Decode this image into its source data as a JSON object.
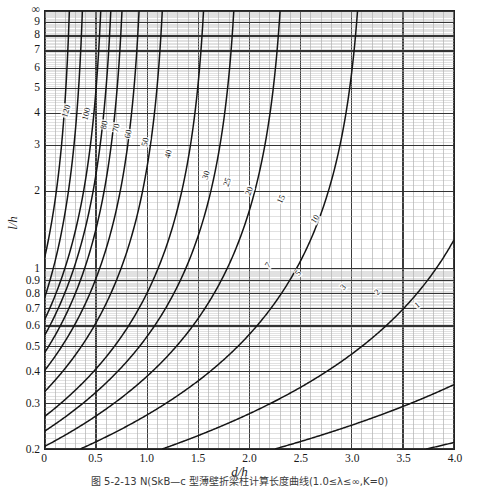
{
  "figure": {
    "caption": "图 5-2-13  N(SkB—c 型薄壁折梁柱计算长度曲线(1.0≤λ≤∞,K=0)",
    "x_axis_title": "d/h",
    "y_axis_title": "l/h"
  },
  "chart_data": {
    "type": "line",
    "title": "",
    "xlabel": "d/h",
    "ylabel": "l/h",
    "xlim": [
      0,
      4.0
    ],
    "ylim": [
      0.2,
      10
    ],
    "xscale": "linear",
    "yscale": "log",
    "grid": true,
    "legend": "inline-curve-labels",
    "ytick_labels": [
      "0.2",
      "0.3",
      "0.4",
      "0.5",
      "0.6",
      "0.7",
      "0.8",
      "0.9",
      "1",
      "2",
      "3",
      "4",
      "5",
      "6",
      "7",
      "8",
      "9",
      "∞"
    ],
    "ytick_values": [
      0.2,
      0.3,
      0.4,
      0.5,
      0.6,
      0.7,
      0.8,
      0.9,
      1,
      2,
      3,
      4,
      5,
      6,
      7,
      8,
      9,
      10
    ],
    "xtick_labels": [
      "0",
      "0.5",
      "1.0",
      "1.5",
      "2.0",
      "2.5",
      "3.0",
      "3.5",
      "4.0"
    ],
    "xtick_values": [
      0,
      0.5,
      1.0,
      1.5,
      2.0,
      2.5,
      3.0,
      3.5,
      4.0
    ],
    "minor_grid_x_step": 0.1,
    "series": [
      {
        "name": "120",
        "asymptote_x": 0.28,
        "y_at_x0": 1.12,
        "label_x": 0.2,
        "label_y": 4.1,
        "label_angle": -72
      },
      {
        "name": "100",
        "asymptote_x": 0.41,
        "y_at_x0": 0.78,
        "label_x": 0.395,
        "label_y": 4.0,
        "label_angle": -76
      },
      {
        "name": "80",
        "asymptote_x": 0.6,
        "y_at_x0": 0.64,
        "label_x": 0.575,
        "label_y": 3.62,
        "label_angle": -78
      },
      {
        "name": "70",
        "asymptote_x": 0.7,
        "y_at_x0": 0.555,
        "label_x": 0.695,
        "label_y": 3.52,
        "label_angle": -78
      },
      {
        "name": "60",
        "asymptote_x": 0.81,
        "y_at_x0": 0.475,
        "label_x": 0.805,
        "label_y": 3.35,
        "label_angle": -78
      },
      {
        "name": "50",
        "asymptote_x": 0.98,
        "y_at_x0": 0.405,
        "label_x": 0.975,
        "label_y": 3.12,
        "label_angle": -78
      },
      {
        "name": "40",
        "asymptote_x": 1.21,
        "y_at_x0": 0.335,
        "label_x": 1.195,
        "label_y": 2.8,
        "label_angle": -76
      },
      {
        "name": "30",
        "asymptote_x": 1.62,
        "y_at_x0": 0.268,
        "label_x": 1.565,
        "label_y": 2.32,
        "label_angle": -72
      },
      {
        "name": "25",
        "asymptote_x": 1.92,
        "y_at_x0": 0.235,
        "label_x": 1.775,
        "label_y": 2.18,
        "label_angle": -70
      },
      {
        "name": "20",
        "asymptote_x": 2.38,
        "y_at_x0": 0.205,
        "label_x": 1.985,
        "label_y": 2.02,
        "label_angle": -68
      },
      {
        "name": "15",
        "asymptote_x": 3.15,
        "y_at_x0": 0.175,
        "label_x": 2.3,
        "label_y": 1.88,
        "label_angle": -64
      },
      {
        "name": "10",
        "asymptote_x": 4.7,
        "y_at_x0": 0.145,
        "label_x": 2.63,
        "label_y": 1.58,
        "label_angle": -58
      },
      {
        "name": "7",
        "asymptote_x": 6.7,
        "y_at_x0": 0.125,
        "label_x": 2.17,
        "label_y": 1.05,
        "label_angle": -52
      },
      {
        "name": "5",
        "asymptote_x": 9.2,
        "y_at_x0": 0.11,
        "label_x": 2.46,
        "label_y": 0.97,
        "label_angle": -50
      },
      {
        "name": "3",
        "asymptote_x": 15.0,
        "y_at_x0": 0.095,
        "label_x": 2.9,
        "label_y": 0.86,
        "label_angle": -46
      },
      {
        "name": "2",
        "asymptote_x": 22.0,
        "y_at_x0": 0.085,
        "label_x": 3.23,
        "label_y": 0.82,
        "label_angle": -44
      },
      {
        "name": "1",
        "asymptote_x": 42.0,
        "y_at_x0": 0.072,
        "label_x": 3.62,
        "label_y": 0.73,
        "label_angle": -40
      }
    ]
  }
}
